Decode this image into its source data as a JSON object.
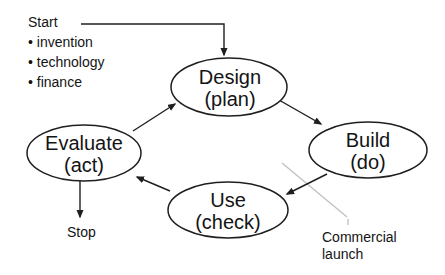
{
  "diagram": {
    "start": {
      "label": "Start",
      "bullets": [
        "• invention",
        "• technology",
        "• finance"
      ]
    },
    "stop": {
      "label": "Stop"
    },
    "nodes": [
      {
        "name": "Design",
        "sub": "(plan)"
      },
      {
        "name": "Build",
        "sub": "(do)"
      },
      {
        "name": "Use",
        "sub": "(check)"
      },
      {
        "name": "Evaluate",
        "sub": "(act)"
      }
    ],
    "annotation": {
      "line1": "Commercial",
      "line2": "launch"
    },
    "colors": {
      "ink": "#1f1f1f",
      "annotation_line": "#c2c2c2",
      "background": "#ffffff"
    }
  }
}
